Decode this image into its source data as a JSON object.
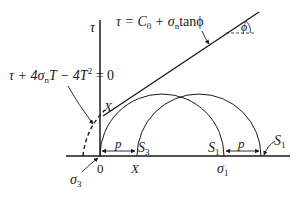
{
  "diagram": {
    "type": "mohr-coulomb-failure-envelope",
    "colors": {
      "ink": "#1a1a1a",
      "background": "#ffffff"
    },
    "axes": {
      "vertical_label": "τ",
      "horizontal_origin_label": "0",
      "sigma3_label": "σ",
      "sigma3_sub": "3",
      "sigma1_label": "σ",
      "sigma1_sub": "1",
      "x_label": "X"
    },
    "equations": {
      "linear_envelope": {
        "lhs": "τ = C",
        "c_sub": "0",
        "mid": " + σ",
        "n_sub": "n",
        "rhs": "tanϕ"
      },
      "parabolic_envelope": {
        "part1": "τ + 4σ",
        "n_sub": "n",
        "part2": "T − 4T",
        "sup": "2",
        "part3": " = 0"
      }
    },
    "angle_label": "ϕ",
    "tangent_point_label": "X",
    "circles": [
      {
        "name": "circle-1",
        "left_label": "σ3 (0)",
        "right_label": "S",
        "right_sub": "1"
      },
      {
        "name": "circle-2",
        "left_label": "S",
        "left_sub": "3",
        "right_label": "S",
        "right_sub": "1"
      }
    ],
    "shift_labels": {
      "p_left": "p",
      "p_right": "p"
    }
  }
}
